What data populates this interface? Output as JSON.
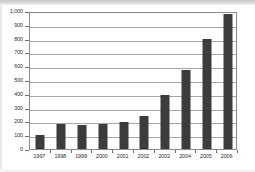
{
  "chart_data": {
    "type": "bar",
    "title": "",
    "subtitle": "",
    "xlabel": "",
    "ylabel": "",
    "categories": [
      "1997",
      "1998",
      "1999",
      "2000",
      "2001",
      "2002",
      "2003",
      "2004",
      "2005",
      "2006"
    ],
    "values": [
      100,
      178,
      172,
      183,
      198,
      240,
      390,
      575,
      795,
      975
    ],
    "series": [
      {
        "name": "",
        "values": [
          100,
          178,
          172,
          183,
          198,
          240,
          390,
          575,
          795,
          975
        ]
      }
    ],
    "ylim": [
      0,
      1000
    ],
    "y_ticks": [
      0,
      100,
      200,
      300,
      400,
      500,
      600,
      700,
      800,
      900,
      1000
    ],
    "y_tick_labels": [
      "0",
      "100",
      "200",
      "300",
      "400",
      "500",
      "600",
      "700",
      "800",
      "900",
      "1,000"
    ],
    "grid": true,
    "grid_axis": "y",
    "legend": false,
    "legend_position": "none",
    "annotations": [],
    "bar_color": "#3c3c3c",
    "gridline_color": "#a6a6a6",
    "axis_color": "#8a8a8a",
    "background_color": "#ffffff"
  }
}
